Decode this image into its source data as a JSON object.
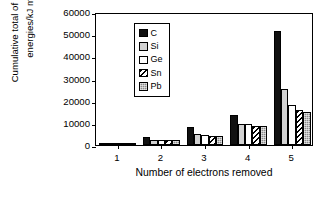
{
  "chart_data": {
    "type": "bar",
    "title": "",
    "xlabel": "Number of electrons removed",
    "ylabel_line1": "Cumulative total of ionization",
    "ylabel_line2": "energies/kJ mol",
    "ylabel_line2_sup": "-1",
    "categories": [
      "1",
      "2",
      "3",
      "4",
      "5"
    ],
    "ylim": [
      0,
      60000
    ],
    "yticks": [
      0,
      10000,
      20000,
      30000,
      40000,
      50000,
      60000
    ],
    "ytick_labels": [
      "0",
      "10000",
      "20000",
      "30000",
      "40000",
      "50000",
      "60000"
    ],
    "grid": false,
    "legend_position": "upper-left-inside",
    "series": [
      {
        "name": "C",
        "fill": "solid-black",
        "color": "#111111",
        "values": [
          1086,
          3438,
          8000,
          13700,
          51400
        ]
      },
      {
        "name": "Si",
        "fill": "light-gray",
        "color": "#d2d2d2",
        "values": [
          786,
          2363,
          5160,
          9550,
          25300
        ]
      },
      {
        "name": "Ge",
        "fill": "white",
        "color": "#ffffff",
        "values": [
          762,
          2296,
          4708,
          9310,
          18000
        ]
      },
      {
        "name": "Sn",
        "fill": "diagonal-hatch",
        "color": "#000000",
        "values": [
          709,
          2120,
          4009,
          8700,
          15600
        ]
      },
      {
        "name": "Pb",
        "fill": "gray-dotted",
        "color": "#8a8a8a",
        "values": [
          716,
          2166,
          4083,
          8700,
          15100
        ]
      }
    ]
  },
  "legend": {
    "items": [
      {
        "label": "C",
        "swatch": "legend-swatch-c"
      },
      {
        "label": "Si",
        "swatch": "legend-swatch-si"
      },
      {
        "label": "Ge",
        "swatch": "legend-swatch-ge"
      },
      {
        "label": "Sn",
        "swatch": "legend-swatch-sn"
      },
      {
        "label": "Pb",
        "swatch": "legend-swatch-pb"
      }
    ]
  }
}
